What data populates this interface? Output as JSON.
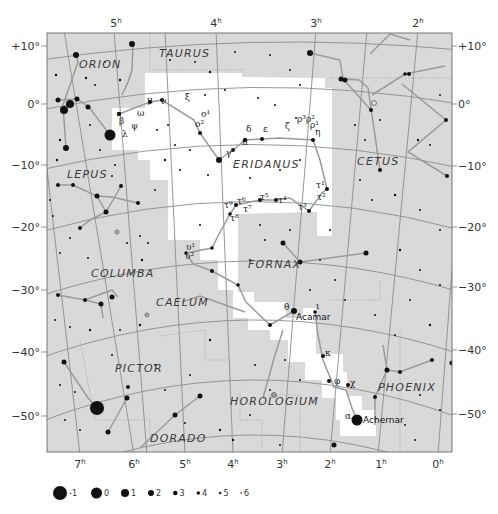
{
  "chart": {
    "colors": {
      "background": "#ffffff",
      "sky_gray": "#d9d9d9",
      "highlight": "#ffffff",
      "grid": "#8c8c8c",
      "stick": "#9a9a9a",
      "star": "#111111",
      "text": "#333333"
    }
  },
  "ra_labels_top": [
    {
      "h": "5",
      "x": 116
    },
    {
      "h": "4",
      "x": 216
    },
    {
      "h": "3",
      "x": 316
    },
    {
      "h": "2",
      "x": 418
    }
  ],
  "ra_labels_bottom": [
    {
      "h": "7",
      "x": 80
    },
    {
      "h": "6",
      "x": 134
    },
    {
      "h": "5",
      "x": 185
    },
    {
      "h": "4",
      "x": 233
    },
    {
      "h": "3",
      "x": 282
    },
    {
      "h": "2",
      "x": 330
    },
    {
      "h": "1",
      "x": 381
    },
    {
      "h": "0",
      "x": 438
    }
  ],
  "dec_labels_left": [
    {
      "label": "+10°",
      "y": 46
    },
    {
      "label": "0°",
      "y": 104
    },
    {
      "label": "−10°",
      "y": 165
    },
    {
      "label": "−20°",
      "y": 227
    },
    {
      "label": "−30°",
      "y": 290
    },
    {
      "label": "−40°",
      "y": 352
    },
    {
      "label": "−50°",
      "y": 416
    }
  ],
  "dec_labels_right": [
    {
      "label": "+10°",
      "y": 46
    },
    {
      "label": "0°",
      "y": 104
    },
    {
      "label": "−10°",
      "y": 166
    },
    {
      "label": "−20°",
      "y": 227
    },
    {
      "label": "−30°",
      "y": 287
    },
    {
      "label": "−40°",
      "y": 350
    },
    {
      "label": "−50°",
      "y": 414
    }
  ],
  "constellations": [
    {
      "name": "TAURUS",
      "x": 159,
      "y": 57
    },
    {
      "name": "ORION",
      "x": 79,
      "y": 68
    },
    {
      "name": "ERIDANUS",
      "x": 233,
      "y": 168
    },
    {
      "name": "CETUS",
      "x": 357,
      "y": 165
    },
    {
      "name": "LEPUS",
      "x": 67,
      "y": 178
    },
    {
      "name": "FORNAX",
      "x": 248,
      "y": 268
    },
    {
      "name": "COLUMBA",
      "x": 91,
      "y": 277
    },
    {
      "name": "CAELUM",
      "x": 156,
      "y": 306
    },
    {
      "name": "PICTOR",
      "x": 115,
      "y": 372
    },
    {
      "name": "HOROLOGIUM",
      "x": 230,
      "y": 405
    },
    {
      "name": "PHOENIX",
      "x": 378,
      "y": 391
    },
    {
      "name": "DORADO",
      "x": 150,
      "y": 442
    }
  ],
  "named_stars": [
    {
      "name": "Acamar",
      "x": 296,
      "y": 320
    },
    {
      "name": "Achernar",
      "x": 363,
      "y": 423
    }
  ],
  "greek_labels": [
    {
      "t": "μ",
      "x": 147,
      "y": 103
    },
    {
      "t": "ν",
      "x": 161,
      "y": 104
    },
    {
      "t": "ξ",
      "x": 185,
      "y": 100
    },
    {
      "t": "ω",
      "x": 137,
      "y": 116
    },
    {
      "t": "β",
      "x": 119,
      "y": 124
    },
    {
      "t": "ψ",
      "x": 131,
      "y": 129
    },
    {
      "t": "λ",
      "x": 122,
      "y": 137
    },
    {
      "t": "ο¹",
      "x": 201,
      "y": 117
    },
    {
      "t": "ο²",
      "x": 195,
      "y": 127
    },
    {
      "t": "δ",
      "x": 246,
      "y": 132
    },
    {
      "t": "ε",
      "x": 263,
      "y": 132
    },
    {
      "t": "ζ",
      "x": 285,
      "y": 129
    },
    {
      "t": "ρ³ρ²",
      "x": 297,
      "y": 122
    },
    {
      "t": "ρ¹",
      "x": 310,
      "y": 128
    },
    {
      "t": "η",
      "x": 315,
      "y": 135
    },
    {
      "t": "π",
      "x": 242,
      "y": 145
    },
    {
      "t": "γ",
      "x": 226,
      "y": 156
    },
    {
      "t": "τ¹",
      "x": 316,
      "y": 188
    },
    {
      "t": "τ²",
      "x": 317,
      "y": 200
    },
    {
      "t": "τ³",
      "x": 298,
      "y": 210
    },
    {
      "t": "τ⁴",
      "x": 278,
      "y": 203
    },
    {
      "t": "τ⁵",
      "x": 260,
      "y": 200
    },
    {
      "t": "τ⁶",
      "x": 237,
      "y": 204
    },
    {
      "t": "τ⁷",
      "x": 243,
      "y": 212
    },
    {
      "t": "τ⁸",
      "x": 230,
      "y": 221
    },
    {
      "t": "τ⁹",
      "x": 224,
      "y": 208
    },
    {
      "t": "υ¹",
      "x": 186,
      "y": 250
    },
    {
      "t": "υ²",
      "x": 185,
      "y": 259
    },
    {
      "t": "θ",
      "x": 284,
      "y": 310
    },
    {
      "t": "ι",
      "x": 316,
      "y": 309
    },
    {
      "t": "κ",
      "x": 325,
      "y": 356
    },
    {
      "t": "φ",
      "x": 334,
      "y": 384
    },
    {
      "t": "χ",
      "x": 350,
      "y": 386
    },
    {
      "t": "α",
      "x": 345,
      "y": 419
    }
  ],
  "legend": {
    "title": "magnitude",
    "items": [
      {
        "label": "-1",
        "r": 7
      },
      {
        "label": "0",
        "r": 5.5
      },
      {
        "label": "1",
        "r": 4
      },
      {
        "label": "2",
        "r": 3
      },
      {
        "label": "3",
        "r": 2.3
      },
      {
        "label": "4",
        "r": 1.7
      },
      {
        "label": "5",
        "r": 1.2
      },
      {
        "label": "6",
        "r": 0.8
      }
    ]
  }
}
